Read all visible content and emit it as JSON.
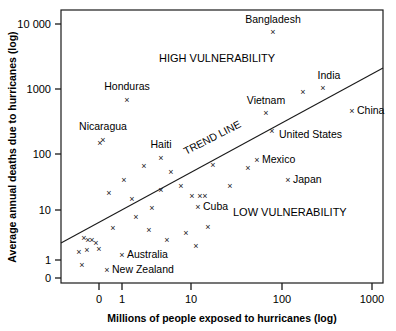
{
  "chart_data": {
    "type": "scatter",
    "title": "",
    "xlabel": "Millions of people exposed to hurricanes (log)",
    "ylabel": "Average annual deaths due to hurricanes (log)",
    "xscale": "log",
    "yscale": "log",
    "xticks": [
      "0",
      "1",
      "10",
      "100",
      "1000"
    ],
    "yticks": [
      "0",
      "1",
      "10",
      "100",
      "1000",
      "10 000"
    ],
    "grid": false,
    "legend": null,
    "annotations": [
      {
        "text": "HIGH VULNERABILITY",
        "x_px": 159,
        "y_px": 62
      },
      {
        "text": "LOW VULNERABILITY",
        "x_px": 233,
        "y_px": 216
      },
      {
        "text": "TREND LINE",
        "x_px": 186,
        "y_px": 155,
        "rotation": -27
      }
    ],
    "trend_line": {
      "label": "TREND LINE",
      "x1_px": 61,
      "y1_px": 243,
      "x2_px": 383,
      "y2_px": 68
    },
    "labeled_points": [
      {
        "name": "Bangladesh",
        "x_px": 273,
        "y_px": 32,
        "label_x_px": 273,
        "label_y_px": 23,
        "label_anchor": "middle"
      },
      {
        "name": "Honduras",
        "x_px": 127,
        "y_px": 100,
        "label_x_px": 127,
        "label_y_px": 90,
        "label_anchor": "middle"
      },
      {
        "name": "Nicaragua",
        "x_px": 103,
        "y_px": 140,
        "label_x_px": 103,
        "label_y_px": 130,
        "label_anchor": "middle"
      },
      {
        "name": "Haiti",
        "x_px": 161,
        "y_px": 158,
        "label_x_px": 161,
        "label_y_px": 148,
        "label_anchor": "middle"
      },
      {
        "name": "India",
        "x_px": 323,
        "y_px": 88,
        "label_x_px": 329,
        "label_y_px": 79,
        "label_anchor": "middle"
      },
      {
        "name": "China",
        "x_px": 352,
        "y_px": 111,
        "label_x_px": 357,
        "label_y_px": 114,
        "label_anchor": "start"
      },
      {
        "name": "Vietnam",
        "x_px": 266,
        "y_px": 113,
        "label_x_px": 266,
        "label_y_px": 104,
        "label_anchor": "middle"
      },
      {
        "name": "United States",
        "x_px": 272,
        "y_px": 131,
        "label_x_px": 279,
        "label_y_px": 138,
        "label_anchor": "start"
      },
      {
        "name": "Mexico",
        "x_px": 257,
        "y_px": 160,
        "label_x_px": 262,
        "label_y_px": 163,
        "label_anchor": "start"
      },
      {
        "name": "Japan",
        "x_px": 288,
        "y_px": 180,
        "label_x_px": 293,
        "label_y_px": 183,
        "label_anchor": "start"
      },
      {
        "name": "Cuba",
        "x_px": 198,
        "y_px": 207,
        "label_x_px": 203,
        "label_y_px": 210,
        "label_anchor": "start"
      },
      {
        "name": "Australia",
        "x_px": 122,
        "y_px": 255,
        "label_x_px": 127,
        "label_y_px": 258,
        "label_anchor": "start"
      },
      {
        "name": "New Zealand",
        "x_px": 107,
        "y_px": 270,
        "label_x_px": 112,
        "label_y_px": 273,
        "label_anchor": "start"
      }
    ],
    "unlabeled_points": [
      {
        "x_px": 100,
        "y_px": 143
      },
      {
        "x_px": 144,
        "y_px": 166
      },
      {
        "x_px": 124,
        "y_px": 180
      },
      {
        "x_px": 171,
        "y_px": 172
      },
      {
        "x_px": 181,
        "y_px": 186
      },
      {
        "x_px": 248,
        "y_px": 168
      },
      {
        "x_px": 213,
        "y_px": 165
      },
      {
        "x_px": 303,
        "y_px": 92
      },
      {
        "x_px": 109,
        "y_px": 193
      },
      {
        "x_px": 132,
        "y_px": 199
      },
      {
        "x_px": 152,
        "y_px": 208
      },
      {
        "x_px": 161,
        "y_px": 190
      },
      {
        "x_px": 192,
        "y_px": 196
      },
      {
        "x_px": 200,
        "y_px": 196
      },
      {
        "x_px": 205,
        "y_px": 196
      },
      {
        "x_px": 230,
        "y_px": 186
      },
      {
        "x_px": 113,
        "y_px": 228
      },
      {
        "x_px": 136,
        "y_px": 217
      },
      {
        "x_px": 149,
        "y_px": 230
      },
      {
        "x_px": 167,
        "y_px": 240
      },
      {
        "x_px": 186,
        "y_px": 233
      },
      {
        "x_px": 196,
        "y_px": 246
      },
      {
        "x_px": 208,
        "y_px": 227
      },
      {
        "x_px": 84,
        "y_px": 238
      },
      {
        "x_px": 88,
        "y_px": 240
      },
      {
        "x_px": 92,
        "y_px": 240
      },
      {
        "x_px": 96,
        "y_px": 243
      },
      {
        "x_px": 87,
        "y_px": 250
      },
      {
        "x_px": 99,
        "y_px": 249
      },
      {
        "x_px": 79,
        "y_px": 252
      },
      {
        "x_px": 82,
        "y_px": 265
      }
    ]
  },
  "axes": {
    "x_title": "Millions of people exposed to hurricanes (log)",
    "y_title": "Average annual deaths due to hurricanes (log)",
    "x_tick_labels": [
      {
        "text": "0",
        "x_px": 99
      },
      {
        "text": "1",
        "x_px": 122
      },
      {
        "text": "10",
        "x_px": 191
      },
      {
        "text": "100",
        "x_px": 282
      },
      {
        "text": "1000",
        "x_px": 372
      }
    ],
    "y_tick_labels": [
      {
        "text": "10 000",
        "y_px": 24
      },
      {
        "text": "1000",
        "y_px": 89
      },
      {
        "text": "100",
        "y_px": 154
      },
      {
        "text": "10",
        "y_px": 210
      },
      {
        "text": "1",
        "y_px": 260
      },
      {
        "text": "0",
        "y_px": 278
      }
    ]
  }
}
